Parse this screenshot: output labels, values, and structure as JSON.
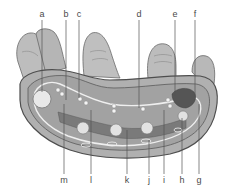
{
  "diagram": {
    "colors": {
      "skin": "#b8b8b8",
      "skin_dark": "#9a9a9a",
      "outline": "#555555",
      "tissue": "#a6a6a6",
      "muscle": "#6e6e6e",
      "bone": "#e6e6e6",
      "tendon_light": "#f2f2f2",
      "leader": "#555555"
    },
    "labels_top": [
      {
        "id": "a",
        "text": "a",
        "x": 42,
        "y": 10,
        "line_to": 90
      },
      {
        "id": "b",
        "text": "b",
        "x": 66,
        "y": 10,
        "line_to": 100
      },
      {
        "id": "c",
        "text": "c",
        "x": 79,
        "y": 10,
        "line_to": 98
      },
      {
        "id": "d",
        "text": "d",
        "x": 139,
        "y": 10,
        "line_to": 105
      },
      {
        "id": "e",
        "text": "e",
        "x": 175,
        "y": 10,
        "line_to": 96
      },
      {
        "id": "f",
        "text": "f",
        "x": 195,
        "y": 10,
        "line_to": 98
      }
    ],
    "labels_bottom": [
      {
        "id": "m",
        "text": "m",
        "x": 64,
        "y": 178,
        "line_from": 105
      },
      {
        "id": "l",
        "text": "l",
        "x": 91,
        "y": 178,
        "line_from": 112
      },
      {
        "id": "k",
        "text": "k",
        "x": 127,
        "y": 178,
        "line_from": 130
      },
      {
        "id": "j",
        "text": "j",
        "x": 149,
        "y": 178,
        "line_from": 140
      },
      {
        "id": "i",
        "text": "i",
        "x": 164,
        "y": 178,
        "line_from": 112
      },
      {
        "id": "h",
        "text": "h",
        "x": 182,
        "y": 178,
        "line_from": 118
      },
      {
        "id": "g",
        "text": "g",
        "x": 199,
        "y": 178,
        "line_from": 105
      }
    ]
  }
}
